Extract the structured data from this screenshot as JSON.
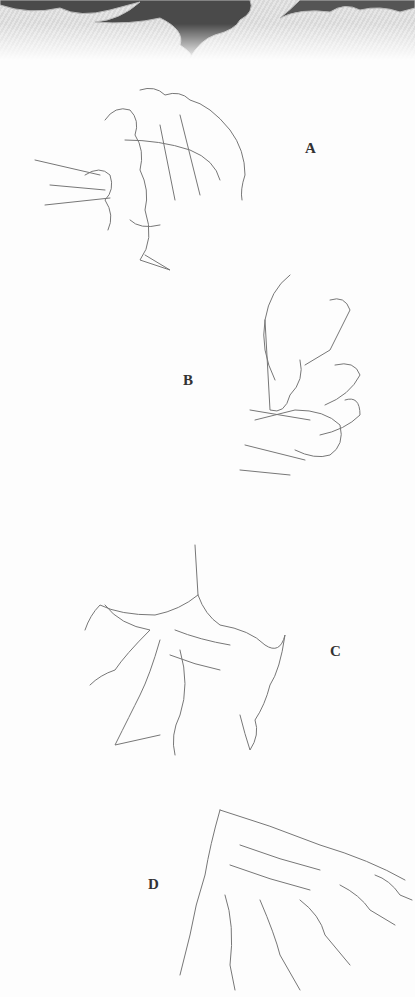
{
  "header": {
    "decoration": "flame-tribal-banner"
  },
  "figures": [
    {
      "id": "A",
      "label": "A",
      "subject": "claw-sketch-curled"
    },
    {
      "id": "B",
      "label": "B",
      "subject": "claw-sketch-side"
    },
    {
      "id": "C",
      "label": "C",
      "subject": "claw-sketch-spread"
    },
    {
      "id": "D",
      "label": "D",
      "subject": "claw-sketch-reaching"
    }
  ]
}
